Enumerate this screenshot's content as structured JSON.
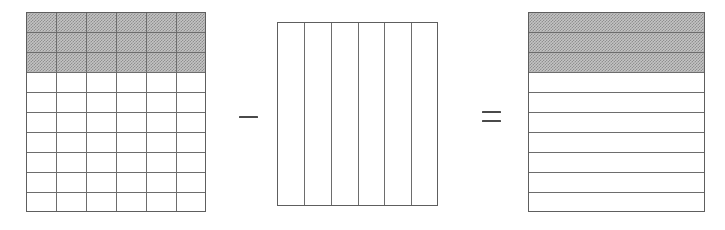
{
  "figure": {
    "title": "Grid decomposition identity",
    "caption": "",
    "background_color": "#ffffff",
    "line_color": "#6d6d6d",
    "border_color": "#5e5e5e",
    "shade_color": "#c4c4c4",
    "operator_color": "#4a4a4a"
  },
  "operators": [
    {
      "name": "minus",
      "symbol": "−",
      "label": "minus",
      "position": {
        "x": 236,
        "y": 104
      }
    },
    {
      "name": "equals",
      "symbol": "=",
      "label": "equals",
      "position": {
        "x": 479,
        "y": 104
      }
    }
  ],
  "panels": [
    {
      "id": "panel-full-grid",
      "name": "full-grid",
      "label": "Full grid",
      "geometry": {
        "x": 26,
        "y": 12,
        "width": 180,
        "height": 200
      },
      "rows": 10,
      "columns": 6,
      "show_horizontal_rules": true,
      "show_vertical_rules": true,
      "shaded_rows": [
        0,
        1,
        2
      ],
      "shaded_row_count": 3,
      "unshaded_row_count": 7
    },
    {
      "id": "panel-vertical-strips",
      "name": "vertical-strips",
      "label": "Vertical strips only",
      "geometry": {
        "x": 277,
        "y": 22,
        "width": 161,
        "height": 184
      },
      "rows": 1,
      "columns": 6,
      "show_horizontal_rules": false,
      "show_vertical_rules": true,
      "shaded_rows": [],
      "shaded_row_count": 0,
      "unshaded_row_count": 1
    },
    {
      "id": "panel-horizontal-strips",
      "name": "horizontal-strips",
      "label": "Horizontal strips only",
      "geometry": {
        "x": 528,
        "y": 12,
        "width": 177,
        "height": 200
      },
      "rows": 10,
      "columns": 1,
      "show_horizontal_rules": true,
      "show_vertical_rules": false,
      "shaded_rows": [
        0,
        1,
        2
      ],
      "shaded_row_count": 3,
      "unshaded_row_count": 7
    }
  ]
}
